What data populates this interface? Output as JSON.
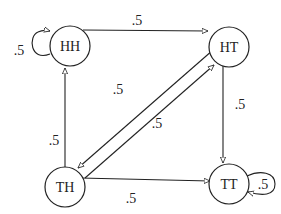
{
  "diagram": {
    "type": "state-transition",
    "nodes": {
      "hh": {
        "label": "HH"
      },
      "ht": {
        "label": "HT"
      },
      "th": {
        "label": "TH"
      },
      "tt": {
        "label": "TT"
      }
    },
    "edges": {
      "hh_hh": {
        "from": "HH",
        "to": "HH",
        "label": ".5"
      },
      "hh_ht": {
        "from": "HH",
        "to": "HT",
        "label": ".5"
      },
      "th_hh": {
        "from": "TH",
        "to": "HH",
        "label": ".5"
      },
      "ht_th": {
        "from": "HT",
        "to": "TH",
        "label": ".5"
      },
      "th_ht": {
        "from": "TH",
        "to": "HT",
        "label": ".5"
      },
      "ht_tt": {
        "from": "HT",
        "to": "TT",
        "label": ".5"
      },
      "th_tt": {
        "from": "TH",
        "to": "TT",
        "label": ".5"
      },
      "tt_tt": {
        "from": "TT",
        "to": "TT",
        "label": ".5"
      }
    }
  }
}
